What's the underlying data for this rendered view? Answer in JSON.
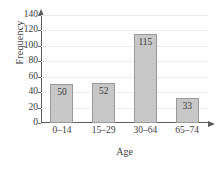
{
  "chart_data": {
    "type": "bar",
    "title": "",
    "xlabel": "Age",
    "ylabel": "Frequency",
    "categories": [
      "0–14",
      "15–29",
      "30–64",
      "65–74"
    ],
    "values": [
      50,
      52,
      115,
      33
    ],
    "value_labels": [
      "50",
      "52",
      "115",
      "33"
    ],
    "ylim": [
      0,
      140
    ],
    "ytick_values": [
      0,
      20,
      40,
      60,
      80,
      100,
      120,
      140
    ],
    "ytick_labels": [
      "0",
      "20",
      "40",
      "60",
      "80",
      "100",
      "120",
      "140"
    ],
    "grid": true,
    "grid_axis": "y",
    "legend": "none",
    "bar_fill_color": "#c7c7c7",
    "bar_border_color": "#9a9a9a",
    "axis_color": "#5c5c5c",
    "gridline_color": "#ececec",
    "text_color": "#3d3d3d",
    "background_color": "#ffffff",
    "y_axis_arrow": true,
    "x_axis_arrow": true
  }
}
